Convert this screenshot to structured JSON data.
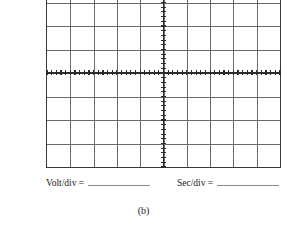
{
  "figure": {
    "caption": "(b)",
    "type": "oscilloscope-graticule"
  },
  "graticule": {
    "columns": 10,
    "rows": 8,
    "horizontal_axis_ticks": 50,
    "vertical_axis_ticks": 40,
    "grid_color": "#6b6b6b",
    "axis_color": "#2b2b2b",
    "border_color": "#3a3a3a",
    "background": "#ffffff"
  },
  "labels": {
    "volt_per_div": "Volt/div =",
    "sec_per_div": "Sec/div =",
    "volt_value": "",
    "sec_value": ""
  }
}
